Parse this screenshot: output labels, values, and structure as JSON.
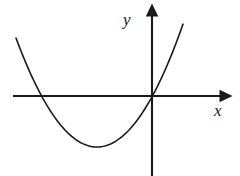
{
  "figure": {
    "title": "",
    "background_color": "#ffffff",
    "stroke_color": "#1a1a1a",
    "width": 240,
    "height": 176
  },
  "labels": {
    "y_axis": "y",
    "x_axis": "x"
  },
  "chart_data": {
    "type": "line",
    "title": "",
    "xlabel": "x",
    "ylabel": "y",
    "grid": false,
    "legend": "none",
    "curves": [
      {
        "name": "parabola",
        "shape": "parabola",
        "opens": "up",
        "color": "#1a1a1a",
        "line_width": 1.6,
        "vertex_px": [
          97,
          147
        ],
        "x_intercepts_px": [
          44,
          152
        ],
        "endpoints_px": [
          [
            16,
            38
          ],
          [
            183,
            38
          ]
        ],
        "x_px": [
          16,
          30,
          44,
          58,
          72,
          86,
          97,
          110,
          124,
          138,
          152,
          166,
          183
        ],
        "y_px": [
          38,
          66,
          96,
          118,
          134,
          144,
          147,
          144,
          134,
          118,
          96,
          70,
          38
        ]
      }
    ],
    "axes": {
      "origin_px": [
        152,
        96
      ],
      "x_axis": {
        "start_px": [
          13,
          96
        ],
        "end_px": [
          228,
          96
        ],
        "arrow": "end",
        "ticks": [],
        "tick_labels": []
      },
      "y_axis": {
        "start_px": [
          152,
          176
        ],
        "end_px": [
          152,
          8
        ],
        "arrow": "end",
        "ticks": [],
        "tick_labels": []
      }
    }
  }
}
